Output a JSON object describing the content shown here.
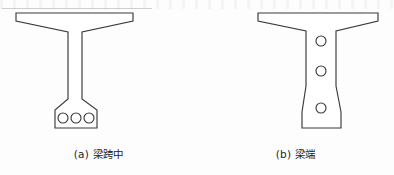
{
  "figure": {
    "type": "engineering-cross-section-diagram",
    "background_color": "#fdfdfd",
    "line_color": "#3a3a3a",
    "fill_color": "#ffffff",
    "panels": [
      {
        "id": "a",
        "caption": "(a) 梁跨中",
        "label_prefix": "(a)",
        "label_text": "梁跨中",
        "section_name": "mid-span-section",
        "web_width": "narrow",
        "holes": {
          "count": 3,
          "arrangement": "horizontal-row",
          "location": "bottom-bulb",
          "radius": 5
        },
        "outline_points": "16,13 133,13 133,21 82,32 82,99 97,110 97,128 55,128 55,110 68,99 68,32 16,21",
        "hole_centers": [
          {
            "cx": 63,
            "cy": 118
          },
          {
            "cx": 76,
            "cy": 118
          },
          {
            "cx": 89,
            "cy": 118
          }
        ]
      },
      {
        "id": "b",
        "caption": "(b) 梁端",
        "label_prefix": "(b)",
        "label_text": "梁端",
        "section_name": "beam-end-section",
        "web_width": "wide",
        "holes": {
          "count": 3,
          "arrangement": "vertical-column",
          "location": "web-and-bottom",
          "radius": 5
        },
        "outline_points": "258,13 378,13 378,21 336,31 336,86 341,112 341,128 302,128 302,112 306,86 306,31 258,21",
        "hole_centers": [
          {
            "cx": 321,
            "cy": 41
          },
          {
            "cx": 321,
            "cy": 71
          },
          {
            "cx": 321,
            "cy": 108
          }
        ]
      }
    ]
  }
}
